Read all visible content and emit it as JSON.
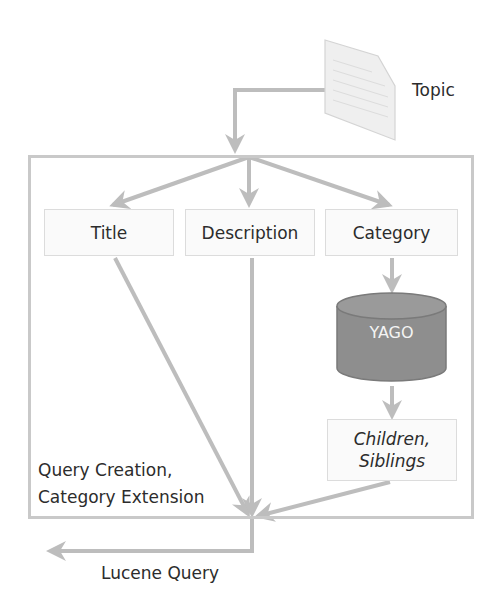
{
  "diagram": {
    "input": {
      "label": "Topic",
      "icon": "document-icon"
    },
    "container": {
      "label_line1": "Query Creation,",
      "label_line2": "Category Extension"
    },
    "fields": [
      {
        "label": "Title"
      },
      {
        "label": "Description"
      },
      {
        "label": "Category"
      }
    ],
    "knowledge_base": {
      "label": "YAGO",
      "icon": "database-icon"
    },
    "extension": {
      "label_line1": "Children,",
      "label_line2": "Siblings"
    },
    "output": {
      "label": "Lucene Query"
    },
    "colors": {
      "arrow": "#bdbdbd",
      "frame": "#c9c9c9",
      "database": "#8e8e8e",
      "box_fill": "#fafafa"
    }
  }
}
